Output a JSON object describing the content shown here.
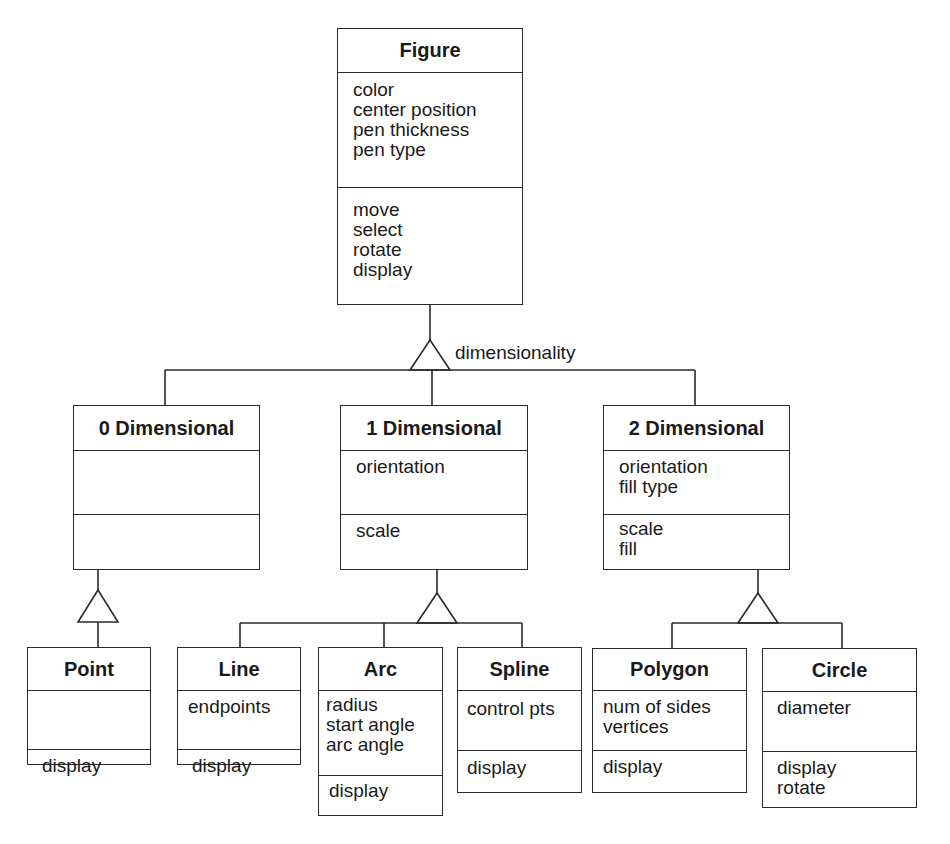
{
  "diagram": {
    "type": "OMT class generalization hierarchy",
    "root": {
      "name": "Figure",
      "attributes": [
        "color",
        "center position",
        "pen thickness",
        "pen type"
      ],
      "operations": [
        "move",
        "select",
        "rotate",
        "display"
      ]
    },
    "discriminator": "dimensionality",
    "level1": [
      {
        "name": "0 Dimensional",
        "attributes": [],
        "operations": []
      },
      {
        "name": "1 Dimensional",
        "attributes": [
          "orientation"
        ],
        "operations": [
          "scale"
        ]
      },
      {
        "name": "2 Dimensional",
        "attributes": [
          "orientation",
          "fill type"
        ],
        "operations": [
          "scale",
          "fill"
        ]
      }
    ],
    "level2": {
      "zero_d": [
        {
          "name": "Point",
          "attributes": [],
          "operations": [
            "display"
          ]
        }
      ],
      "one_d": [
        {
          "name": "Line",
          "attributes": [
            "endpoints"
          ],
          "operations": [
            "display"
          ]
        },
        {
          "name": "Arc",
          "attributes": [
            "radius",
            "start angle",
            "arc angle"
          ],
          "operations": [
            "display"
          ]
        },
        {
          "name": "Spline",
          "attributes": [
            "control pts"
          ],
          "operations": [
            "display"
          ]
        }
      ],
      "two_d": [
        {
          "name": "Polygon",
          "attributes": [
            "num of sides",
            "vertices"
          ],
          "operations": [
            "display"
          ]
        },
        {
          "name": "Circle",
          "attributes": [
            "diameter"
          ],
          "operations": [
            "display",
            "rotate"
          ]
        }
      ]
    }
  },
  "colors": {
    "line": "#2a2a2a",
    "text": "#1a1a1a",
    "background": "#ffffff"
  }
}
